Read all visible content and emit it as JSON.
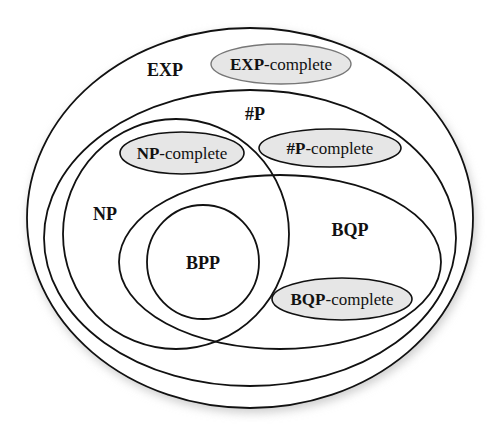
{
  "diagram": {
    "title": "",
    "colors": {
      "stroke": "#111111",
      "complete_fill": "#e6e6e6",
      "background": "#ffffff",
      "shadow": "#d0d0d0"
    },
    "classes": [
      {
        "id": "EXP",
        "label": "EXP",
        "shape": {
          "cx": 250,
          "cy": 218,
          "rx": 223,
          "ry": 190
        },
        "label_pos": [
          165,
          76
        ]
      },
      {
        "id": "sharpP",
        "label": "#P",
        "shape": {
          "cx": 250,
          "cy": 238,
          "rx": 206,
          "ry": 148
        },
        "label_pos": [
          255,
          120
        ]
      },
      {
        "id": "NP",
        "label": "NP",
        "shape": {
          "cx": 176,
          "cy": 234,
          "rx": 113,
          "ry": 115
        },
        "label_pos": [
          105,
          220
        ]
      },
      {
        "id": "BQP",
        "label": "BQP",
        "shape": {
          "cx": 280,
          "cy": 262,
          "rx": 161,
          "ry": 87
        },
        "label_pos": [
          350,
          236
        ]
      },
      {
        "id": "BPP",
        "label": "BPP",
        "shape": {
          "cx": 203,
          "cy": 262,
          "rx": 56,
          "ry": 57
        },
        "label_pos": [
          203,
          269
        ]
      }
    ],
    "complete_sets": [
      {
        "id": "EXP-complete",
        "bold": "EXP",
        "rest": "-complete",
        "shape": {
          "cx": 281,
          "cy": 64,
          "rx": 70,
          "ry": 20
        }
      },
      {
        "id": "NP-complete",
        "bold": "NP",
        "rest": "-complete",
        "shape": {
          "cx": 182,
          "cy": 153,
          "rx": 62,
          "ry": 21
        }
      },
      {
        "id": "sharpP-complete",
        "bold": "#P",
        "rest": "-complete",
        "shape": {
          "cx": 330,
          "cy": 148,
          "rx": 71,
          "ry": 19
        }
      },
      {
        "id": "BQP-complete",
        "bold": "BQP",
        "rest": "-complete",
        "shape": {
          "cx": 342,
          "cy": 299,
          "rx": 70,
          "ry": 21
        }
      }
    ],
    "relations": [
      {
        "from": "BPP",
        "to": "BQP",
        "type": "subset"
      },
      {
        "from": "BPP",
        "to": "NP",
        "type": "overlap-region"
      },
      {
        "from": "NP",
        "to": "sharpP",
        "type": "subset"
      },
      {
        "from": "BQP",
        "to": "sharpP",
        "type": "subset"
      },
      {
        "from": "NP",
        "to": "BQP",
        "type": "overlap"
      },
      {
        "from": "sharpP",
        "to": "EXP",
        "type": "subset"
      }
    ]
  }
}
